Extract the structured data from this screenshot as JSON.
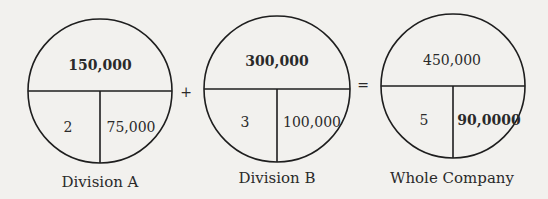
{
  "diagrams": [
    {
      "label": "Division A",
      "top": "150,000",
      "bottom_left": "2",
      "bottom_right": "75,000",
      "top_bold": true,
      "right_bold": false
    },
    {
      "label": "Division B",
      "top": "300,000",
      "bottom_left": "3",
      "bottom_right": "100,000",
      "top_bold": true,
      "right_bold": false
    },
    {
      "label": "Whole Company",
      "top": "450,000",
      "bottom_left": "5",
      "bottom_right": "90,0000",
      "top_bold": false,
      "right_bold": true
    }
  ],
  "operators": {
    "plus": "+",
    "equals": "="
  },
  "colors": {
    "line": "#1e1e1e",
    "background": "#f2f1ee"
  }
}
